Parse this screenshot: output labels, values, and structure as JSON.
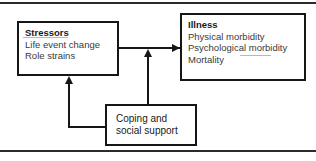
{
  "figure": {
    "colors": {
      "background": "#ffffff",
      "box_border": "#161616",
      "rule": "#2b2b2b",
      "heading_text": "#1a1a1a",
      "body_text": "#3a3a3a",
      "arrow": "#161616"
    }
  },
  "nodes": {
    "stressors": {
      "title": "Stressors",
      "lines": [
        "Life event change",
        "Role strains"
      ]
    },
    "illness": {
      "title": "Illness",
      "lines": [
        "Physical morbidity",
        "Psychological morbidity",
        "Mortality"
      ]
    },
    "coping": {
      "lines": [
        "Coping and",
        "social support"
      ]
    }
  },
  "connectors": [
    {
      "name": "stressors-to-illness",
      "from": "stressors",
      "to": "illness",
      "style": "straight-arrow",
      "direction": "right"
    },
    {
      "name": "coping-to-stressors-illness-path",
      "from": "coping",
      "to": "stressors-to-illness-arrow",
      "style": "straight-arrow",
      "direction": "up"
    },
    {
      "name": "coping-to-stressors",
      "from": "coping",
      "to": "stressors",
      "style": "elbow-arrow",
      "direction": "up"
    }
  ]
}
